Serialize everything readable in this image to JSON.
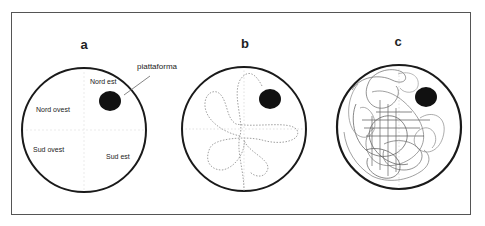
{
  "figure": {
    "panels": [
      {
        "id": "a",
        "label": "a",
        "quadrants": {
          "ne": "Nord est",
          "nw": "Nord ovest",
          "sw": "Sud ovest",
          "se": "Sud est"
        },
        "platform_label": "piattaforma"
      },
      {
        "id": "b",
        "label": "b"
      },
      {
        "id": "c",
        "label": "c"
      }
    ],
    "colors": {
      "border": "#555555",
      "circle": "#1a1a1a",
      "platform": "#111111",
      "path": "#888888",
      "text": "#222222"
    }
  }
}
